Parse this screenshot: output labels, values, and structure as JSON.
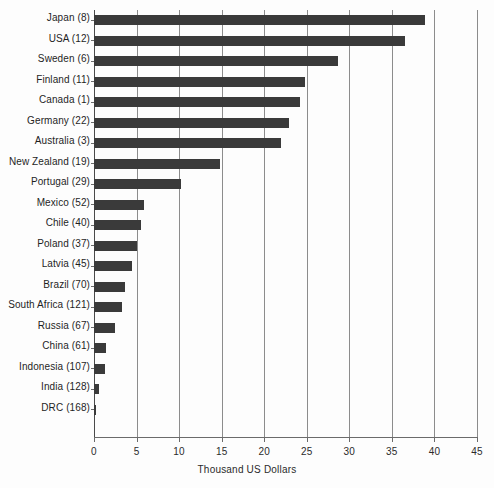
{
  "chart_data": {
    "type": "bar",
    "orientation": "horizontal",
    "title": "",
    "subtitle": "",
    "xlabel": "Thousand US Dollars",
    "ylabel": "",
    "xlim": [
      0,
      45
    ],
    "xticks": [
      0,
      5,
      10,
      15,
      20,
      25,
      30,
      35,
      40,
      45
    ],
    "xtick_labels": [
      "0",
      "5",
      "10",
      "15",
      "20",
      "25",
      "30",
      "35",
      "40",
      "45"
    ],
    "grid": "vertical",
    "legend": "none",
    "bar_color": "#3a3a3a",
    "categories": [
      "Japan (8)",
      "USA (12)",
      "Sweden (6)",
      "Finland (11)",
      "Canada (1)",
      "Germany (22)",
      "Australia (3)",
      "New Zealand (19)",
      "Portugal (29)",
      "Mexico (52)",
      "Chile (40)",
      "Poland (37)",
      "Latvia (45)",
      "Brazil (70)",
      "South Africa (121)",
      "Russia (67)",
      "China (61)",
      "Indonesia (107)",
      "India (128)",
      "DRC (168)"
    ],
    "values": [
      38.9,
      36.5,
      28.7,
      24.8,
      24.2,
      22.9,
      22.0,
      14.8,
      10.2,
      5.9,
      5.5,
      5.1,
      4.5,
      3.7,
      3.3,
      2.5,
      1.4,
      1.3,
      0.6,
      0.2
    ]
  }
}
